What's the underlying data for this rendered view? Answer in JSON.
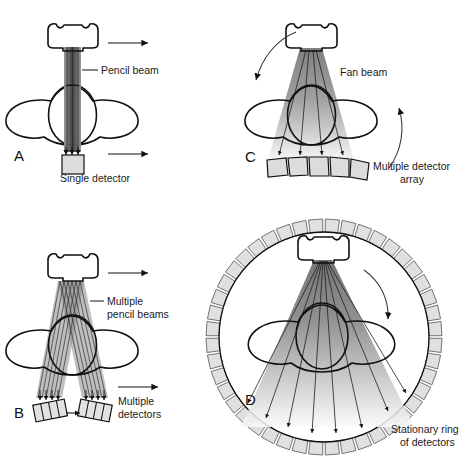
{
  "figure": {
    "background_color": "#ffffff",
    "ink_color": "#111111"
  },
  "panels": [
    {
      "id": "A",
      "letter": "A",
      "generation": "first",
      "beam_type": "pencil beam",
      "detector_type": "single detector",
      "motion": "translate",
      "labels": {
        "beam": "Pencil beam",
        "detector": "Single detector"
      },
      "translation_arrows": 2,
      "beam_ray_count": 4,
      "detector_count": 1,
      "rotation_arrow": false
    },
    {
      "id": "B",
      "letter": "B",
      "generation": "second",
      "beam_type": "multiple pencil beams",
      "detector_type": "multiple detectors",
      "motion": "translate",
      "labels": {
        "beam_line1": "Multiple",
        "beam_line2": "pencil beams",
        "detector_line1": "Multiple",
        "detector_line2": "detectors"
      },
      "translation_arrows": 2,
      "beam_ray_count": 12,
      "detector_banks": 2,
      "detector_cells_per_bank": 4,
      "rotation_arrow": false
    },
    {
      "id": "C",
      "letter": "C",
      "generation": "third",
      "beam_type": "fan beam",
      "detector_type": "multiple detector array",
      "motion": "rotate",
      "labels": {
        "beam": "Fan beam",
        "detector_line1": "Multiple detector",
        "detector_line2": "array"
      },
      "beam_ray_count": 4,
      "detector_count": 5,
      "rotation_arrow": true,
      "rotation_arrows": 2
    },
    {
      "id": "D",
      "letter": "D",
      "generation": "fourth",
      "beam_type": "fan beam",
      "detector_type": "stationary ring of detectors",
      "motion": "rotate",
      "labels": {
        "detector_line1": "Stationary ring",
        "detector_line2": "of detectors"
      },
      "beam_ray_count": 9,
      "ring_segment_count": 44,
      "rotation_arrow": true
    }
  ],
  "colors": {
    "tube_fill_light": "#e8e8e8",
    "tube_fill_mid": "#cfcfcf",
    "detector_fill": "#dcdcdc",
    "beam_dark": "#4a4a4a",
    "beam_light": "#f0f0f0",
    "outline": "#111111"
  },
  "icons": {
    "translation_arrow": "arrow-right-icon",
    "rotation_arrow": "curved-arrow-icon",
    "xray_tube": "xray-tube-icon",
    "patient": "patient-cross-section-icon"
  }
}
